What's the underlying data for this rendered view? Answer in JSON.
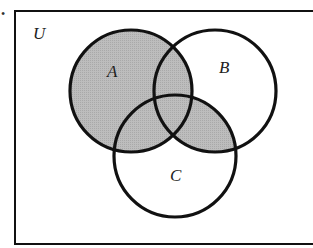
{
  "diagram": {
    "type": "venn",
    "universe_label": "U",
    "sets": [
      {
        "name": "A",
        "label": "A",
        "cx": 131,
        "cy": 91,
        "r": 61
      },
      {
        "name": "B",
        "label": "B",
        "cx": 215,
        "cy": 91,
        "r": 61
      },
      {
        "name": "C",
        "label": "C",
        "cx": 175,
        "cy": 156,
        "r": 61
      }
    ],
    "shaded_region": "A ∪ (B ∩ C)",
    "colors": {
      "shade": "#b4b4b4",
      "stroke": "#111111",
      "background": "#ffffff"
    },
    "marker": "•"
  }
}
